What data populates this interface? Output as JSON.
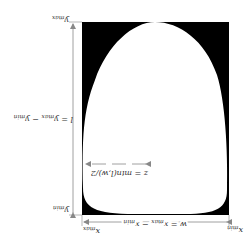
{
  "figure": {
    "orientation": "rotated-180",
    "rect": {
      "x0": 82,
      "y0": 22,
      "x1": 229,
      "y1": 215,
      "fill": "#000000"
    },
    "blob_fill": "#ffffff",
    "arrow_color": "#888888",
    "labels": {
      "y_max": {
        "main": "y",
        "sub": "max"
      },
      "y_min": {
        "main": "y",
        "sub": "min"
      },
      "x_max": {
        "main": "x",
        "sub": "max"
      },
      "x_min": {
        "main": "x",
        "sub": "min"
      },
      "height_formula": {
        "lhs": "l = y",
        "sub1": "max",
        "mid": " − y",
        "sub2": "min"
      },
      "width_formula": {
        "lhs": "w = x",
        "sub1": "max",
        "mid": " − x",
        "sub2": "min"
      },
      "z_formula": "z = min(l,w)/2"
    }
  }
}
